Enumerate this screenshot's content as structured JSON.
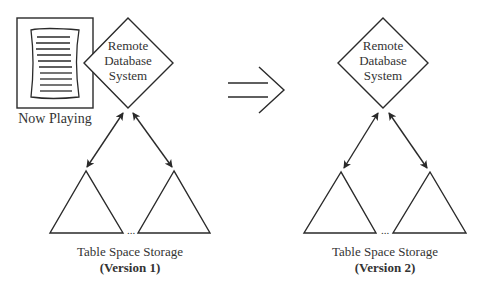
{
  "diagram": {
    "left": {
      "database_label": [
        "Remote",
        "Database",
        "System"
      ],
      "document_icon": "document-icon",
      "document_caption": "Now Playing",
      "storage_label": "Table Space Storage",
      "version_label": "(Version 1)",
      "ellipsis": "..."
    },
    "transition_arrow": "double-arrow-right-icon",
    "right": {
      "database_label": [
        "Remote",
        "Database",
        "System"
      ],
      "storage_label": "Table Space Storage",
      "version_label": "(Version 2)",
      "ellipsis": "..."
    },
    "colors": {
      "stroke": "#2a2a2a",
      "background": "#ffffff"
    }
  }
}
